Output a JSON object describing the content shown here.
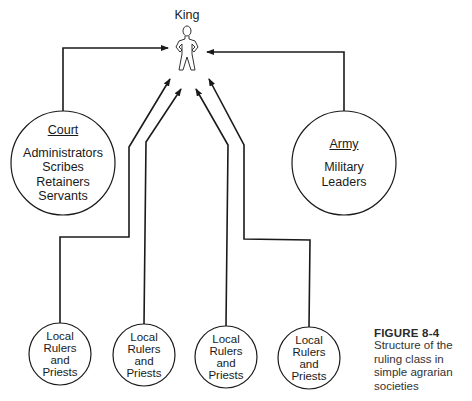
{
  "diagram": {
    "king": {
      "label": "King",
      "icon": "person-figure-icon"
    },
    "court": {
      "title": "Court",
      "items": [
        "Administrators",
        "Scribes",
        "Retainers",
        "Servants"
      ]
    },
    "army": {
      "title": "Army",
      "items": [
        "Military",
        "Leaders"
      ]
    },
    "local_nodes": [
      {
        "lines": [
          "Local",
          "Rulers",
          "and",
          "Priests"
        ]
      },
      {
        "lines": [
          "Local",
          "Rulers",
          "and",
          "Priests"
        ]
      },
      {
        "lines": [
          "Local",
          "Rulers",
          "and",
          "Priests"
        ]
      },
      {
        "lines": [
          "Local",
          "Rulers",
          "and",
          "Priests"
        ]
      }
    ],
    "edges": [
      {
        "from": "Court",
        "to": "King"
      },
      {
        "from": "Army",
        "to": "King"
      },
      {
        "from": "Local Rulers and Priests 1",
        "to": "King"
      },
      {
        "from": "Local Rulers and Priests 2",
        "to": "King"
      },
      {
        "from": "Local Rulers and Priests 3",
        "to": "King"
      },
      {
        "from": "Local Rulers and Priests 4",
        "to": "King"
      }
    ]
  },
  "caption": {
    "figure_label": "FIGURE 8-4",
    "text": "Structure of the ruling class in simple agrarian societies"
  },
  "colors": {
    "line": "#1a1a1a",
    "background": "#ffffff"
  }
}
